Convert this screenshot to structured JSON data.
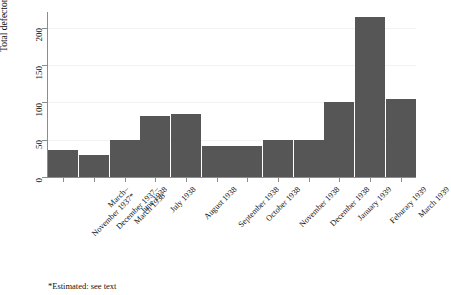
{
  "chart_data": {
    "type": "bar",
    "title": "",
    "xlabel": "",
    "ylabel": "Total defectors",
    "ylim": [
      0,
      220
    ],
    "yticks": [
      0,
      50,
      100,
      150,
      200
    ],
    "grid": true,
    "legend": null,
    "bar_color": "#565656",
    "categories": [
      "March–November 1937*",
      "December 1937–March 1938",
      "June 1938",
      "July 1938",
      "August 1938",
      "September 1938",
      "October 1938",
      "November 1938",
      "December 1938",
      "January 1939",
      "Feburary 1939",
      "March 1939"
    ],
    "category_lines": [
      [
        "March–",
        "November 1937*"
      ],
      [
        "December 1937–",
        "March 1938"
      ],
      [
        "June 1938"
      ],
      [
        "July 1938"
      ],
      [
        "August 1938"
      ],
      [
        "September 1938"
      ],
      [
        "October 1938"
      ],
      [
        "November 1938"
      ],
      [
        "December 1938"
      ],
      [
        "January 1939"
      ],
      [
        "Feburary 1939"
      ],
      [
        "March 1939"
      ]
    ],
    "values": [
      36,
      30,
      50,
      82,
      85,
      42,
      42,
      50,
      50,
      100,
      215,
      105
    ],
    "annotations": [
      "*Estimated: see text"
    ]
  },
  "figure": {
    "ylabel": "Total defectors",
    "footnote": "*Estimated: see text"
  }
}
